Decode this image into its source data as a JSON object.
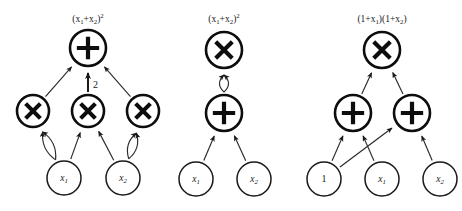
{
  "figure": {
    "background_color": "#ffffff",
    "ink_color": "#1a1a1a",
    "width": 462,
    "height": 211,
    "panel_count": 3
  },
  "panels": [
    {
      "id": "panel-left",
      "title": "(x₁+x₂)²",
      "title_x": 88,
      "title_y": 20,
      "nodes": [
        {
          "id": "L-root",
          "label": "+",
          "kind": "operator",
          "op": "plus",
          "cx": 88,
          "cy": 48,
          "r": 18
        },
        {
          "id": "L-m1",
          "label": "×",
          "kind": "operator",
          "op": "times",
          "cx": 33,
          "cy": 111,
          "r": 16
        },
        {
          "id": "L-m2",
          "label": "×",
          "kind": "operator",
          "op": "times",
          "cx": 88,
          "cy": 111,
          "r": 16
        },
        {
          "id": "L-m3",
          "label": "×",
          "kind": "operator",
          "op": "times",
          "cx": 143,
          "cy": 111,
          "r": 16
        },
        {
          "id": "L-x1",
          "label": "x₁",
          "kind": "leaf",
          "op": "none",
          "cx": 64,
          "cy": 178,
          "r": 17
        },
        {
          "id": "L-x2",
          "label": "x₂",
          "kind": "leaf",
          "op": "none",
          "cx": 123,
          "cy": 178,
          "r": 17
        }
      ],
      "edges": [
        {
          "from": "L-m1",
          "to": "L-root",
          "weight": "",
          "style": "straight"
        },
        {
          "from": "L-m2",
          "to": "L-root",
          "weight": "2",
          "style": "straight-thick"
        },
        {
          "from": "L-m3",
          "to": "L-root",
          "weight": "",
          "style": "straight"
        },
        {
          "from": "L-x1",
          "to": "L-m1",
          "weight": "",
          "style": "curve-left"
        },
        {
          "from": "L-x1",
          "to": "L-m1",
          "weight": "",
          "style": "curve-right"
        },
        {
          "from": "L-x1",
          "to": "L-m2",
          "weight": "",
          "style": "straight"
        },
        {
          "from": "L-x2",
          "to": "L-m2",
          "weight": "",
          "style": "straight"
        },
        {
          "from": "L-x2",
          "to": "L-m3",
          "weight": "",
          "style": "curve-left"
        },
        {
          "from": "L-x2",
          "to": "L-m3",
          "weight": "",
          "style": "curve-right"
        }
      ]
    },
    {
      "id": "panel-middle",
      "title": "(x₁+x₂)²",
      "title_x": 224,
      "title_y": 20,
      "nodes": [
        {
          "id": "M-root",
          "label": "×",
          "kind": "operator",
          "op": "times",
          "cx": 224,
          "cy": 50,
          "r": 18
        },
        {
          "id": "M-plus",
          "label": "+",
          "kind": "operator",
          "op": "plus",
          "cx": 224,
          "cy": 113,
          "r": 18
        },
        {
          "id": "M-x1",
          "label": "x₁",
          "kind": "leaf",
          "op": "none",
          "cx": 196,
          "cy": 179,
          "r": 17
        },
        {
          "id": "M-x2",
          "label": "x₂",
          "kind": "leaf",
          "op": "none",
          "cx": 254,
          "cy": 179,
          "r": 17
        }
      ],
      "edges": [
        {
          "from": "M-plus",
          "to": "M-root",
          "weight": "",
          "style": "curve-left"
        },
        {
          "from": "M-plus",
          "to": "M-root",
          "weight": "",
          "style": "curve-right"
        },
        {
          "from": "M-x1",
          "to": "M-plus",
          "weight": "",
          "style": "straight"
        },
        {
          "from": "M-x2",
          "to": "M-plus",
          "weight": "",
          "style": "straight"
        }
      ]
    },
    {
      "id": "panel-right",
      "title": "(1+x₁)(1+x₂)",
      "title_x": 382,
      "title_y": 20,
      "nodes": [
        {
          "id": "R-root",
          "label": "×",
          "kind": "operator",
          "op": "times",
          "cx": 382,
          "cy": 50,
          "r": 18
        },
        {
          "id": "R-p1",
          "label": "+",
          "kind": "operator",
          "op": "plus",
          "cx": 353,
          "cy": 113,
          "r": 18
        },
        {
          "id": "R-p2",
          "label": "+",
          "kind": "operator",
          "op": "plus",
          "cx": 412,
          "cy": 113,
          "r": 18
        },
        {
          "id": "R-one",
          "label": "1",
          "kind": "leaf",
          "op": "none",
          "cx": 324,
          "cy": 179,
          "r": 17
        },
        {
          "id": "R-x1",
          "label": "x₁",
          "kind": "leaf",
          "op": "none",
          "cx": 382,
          "cy": 179,
          "r": 17
        },
        {
          "id": "R-x2",
          "label": "x₂",
          "kind": "leaf",
          "op": "none",
          "cx": 440,
          "cy": 179,
          "r": 17
        }
      ],
      "edges": [
        {
          "from": "R-p1",
          "to": "R-root",
          "weight": "",
          "style": "straight"
        },
        {
          "from": "R-p2",
          "to": "R-root",
          "weight": "",
          "style": "straight"
        },
        {
          "from": "R-one",
          "to": "R-p1",
          "weight": "",
          "style": "straight"
        },
        {
          "from": "R-x1",
          "to": "R-p1",
          "weight": "",
          "style": "straight"
        },
        {
          "from": "R-one",
          "to": "R-p2",
          "weight": "",
          "style": "straight-cross"
        },
        {
          "from": "R-x2",
          "to": "R-p2",
          "weight": "",
          "style": "straight"
        }
      ]
    }
  ],
  "glyphs": {
    "plus": "+",
    "times": "×"
  }
}
